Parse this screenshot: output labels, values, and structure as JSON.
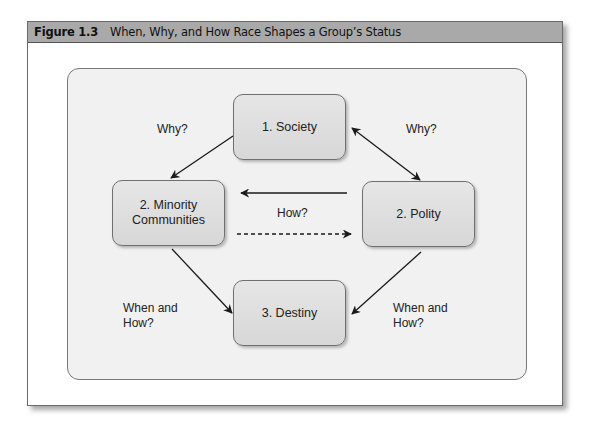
{
  "figure": {
    "number": "Figure 1.3",
    "title": "When, Why, and How Race Shapes a Group’s Status"
  },
  "nodes": {
    "society": {
      "label": "1. Society"
    },
    "minority": {
      "label": "2. Minority\nCommunities"
    },
    "polity": {
      "label": "2. Polity"
    },
    "destiny": {
      "label": "3. Destiny"
    }
  },
  "edges": [
    {
      "from": "society",
      "to": "minority",
      "style": "solid",
      "direction": "forward",
      "label": "Why?"
    },
    {
      "from": "society",
      "to": "polity",
      "style": "solid",
      "direction": "both",
      "label": "Why?"
    },
    {
      "from": "polity",
      "to": "minority",
      "style": "solid",
      "direction": "forward",
      "label": "How?"
    },
    {
      "from": "minority",
      "to": "polity",
      "style": "dashed",
      "direction": "forward",
      "label": "How?"
    },
    {
      "from": "minority",
      "to": "destiny",
      "style": "solid",
      "direction": "forward",
      "label": "When and\nHow?"
    },
    {
      "from": "polity",
      "to": "destiny",
      "style": "solid",
      "direction": "forward",
      "label": "When and\nHow?"
    }
  ],
  "labels": {
    "why_left": "Why?",
    "why_right": "Why?",
    "how_center": "How?",
    "when_how_left": "When and\nHow?",
    "when_how_right": "When and\nHow?"
  },
  "colors": {
    "header_bg": "#a9a9a9",
    "panel_bg": "#f1f1f1",
    "node_fill": "#dedede",
    "arrow": "#1a1a1a"
  }
}
